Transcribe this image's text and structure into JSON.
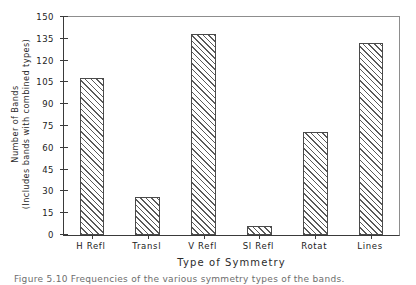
{
  "chart_data": {
    "type": "bar",
    "title": "",
    "xlabel": "Type of Symmetry",
    "ylabel_line1": "Number of Bands",
    "ylabel_line2": "(Includes bands with combined types)",
    "categories": [
      "H Refl",
      "Transl",
      "V Refl",
      "Sl Refl",
      "Rotat",
      "Lines"
    ],
    "values": [
      108,
      26,
      138,
      6,
      71,
      132
    ],
    "ylim": [
      0,
      150
    ],
    "yticks": [
      0,
      15,
      30,
      45,
      60,
      75,
      90,
      105,
      120,
      135,
      150
    ],
    "ytick_labels": [
      "0",
      "15",
      "30",
      "45",
      "60",
      "75",
      "90",
      "105",
      "120",
      "135",
      "150"
    ],
    "grid": false,
    "legend": "none",
    "bar_fill": "diagonal-hatch",
    "colors": {
      "axis": "#3a3a3a",
      "bar_edge": "#4a4a4a",
      "hatch": "#5a5a5a",
      "background": "#ffffff",
      "text": "#222222"
    }
  },
  "caption": {
    "text": "Figure 5.10  Frequencies of the various symmetry types of the bands."
  }
}
